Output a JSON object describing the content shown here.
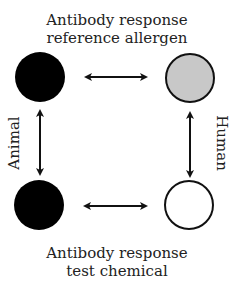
{
  "diagram": {
    "top_label": {
      "line1": "Antibody response",
      "line2": "reference allergen"
    },
    "bottom_label": {
      "line1": "Antibody response",
      "line2": "test chemical"
    },
    "left_label": "Animal",
    "right_label": "Human",
    "nodes": [
      {
        "id": "animal-reference",
        "position": "top-left",
        "fill": "#000000"
      },
      {
        "id": "human-reference",
        "position": "top-right",
        "fill": "#c8c8c8"
      },
      {
        "id": "animal-test",
        "position": "bottom-left",
        "fill": "#000000"
      },
      {
        "id": "human-test",
        "position": "bottom-right",
        "fill": "#ffffff"
      }
    ],
    "edges": [
      {
        "from": "animal-reference",
        "to": "human-reference",
        "type": "bidirectional"
      },
      {
        "from": "animal-test",
        "to": "human-test",
        "type": "bidirectional"
      },
      {
        "from": "animal-reference",
        "to": "animal-test",
        "type": "bidirectional"
      },
      {
        "from": "human-reference",
        "to": "human-test",
        "type": "bidirectional"
      }
    ],
    "colors": {
      "stroke": "#111111",
      "black": "#000000",
      "gray": "#c8c8c8",
      "white": "#ffffff"
    }
  }
}
